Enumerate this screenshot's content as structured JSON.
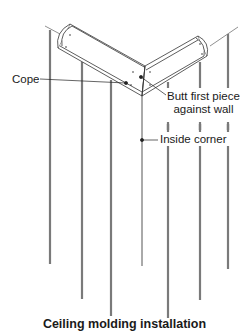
{
  "diagram": {
    "caption": "Ceiling molding installation",
    "labels": {
      "cope": "Cope",
      "butt_line1": "Butt first piece",
      "butt_line2": "against wall",
      "inside_corner": "Inside corner"
    },
    "colors": {
      "line": "#333333",
      "stud": "#7a7a7a",
      "background": "#ffffff"
    }
  }
}
